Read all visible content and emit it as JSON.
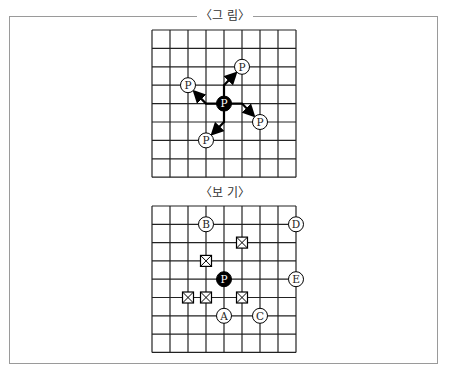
{
  "figure": {
    "title": "〈그 림〉",
    "grid": {
      "cols": 8,
      "rows": 8
    },
    "center_piece": {
      "label": "P",
      "col": 4,
      "row": 4,
      "style": "filled"
    },
    "target_pieces": [
      {
        "label": "P",
        "col": 5,
        "row": 2
      },
      {
        "label": "P",
        "col": 2,
        "row": 3
      },
      {
        "label": "P",
        "col": 6,
        "row": 5
      },
      {
        "label": "P",
        "col": 3,
        "row": 6
      }
    ],
    "arrows": [
      {
        "from": [
          4,
          4
        ],
        "via": [
          4,
          3
        ],
        "to": [
          5,
          2
        ]
      },
      {
        "from": [
          4,
          4
        ],
        "via": [
          3,
          4
        ],
        "to": [
          2,
          3
        ]
      },
      {
        "from": [
          4,
          4
        ],
        "via": [
          5,
          4
        ],
        "to": [
          6,
          5
        ]
      },
      {
        "from": [
          4,
          4
        ],
        "via": [
          4,
          5
        ],
        "to": [
          3,
          6
        ]
      }
    ]
  },
  "options": {
    "title": "〈보 기〉",
    "grid": {
      "cols": 8,
      "rows": 8
    },
    "center_piece": {
      "label": "P",
      "col": 4,
      "row": 4,
      "style": "filled"
    },
    "labeled_points": [
      {
        "label": "A",
        "col": 4,
        "row": 6
      },
      {
        "label": "B",
        "col": 3,
        "row": 1
      },
      {
        "label": "C",
        "col": 6,
        "row": 6
      },
      {
        "label": "D",
        "col": 8,
        "row": 1
      },
      {
        "label": "E",
        "col": 8,
        "row": 4
      }
    ],
    "blocked_points": [
      {
        "col": 5,
        "row": 2
      },
      {
        "col": 3,
        "row": 3
      },
      {
        "col": 2,
        "row": 5
      },
      {
        "col": 3,
        "row": 5
      },
      {
        "col": 5,
        "row": 5
      }
    ]
  },
  "colors": {
    "line": "#222222",
    "frame": "#9a9a9a",
    "filled": "#000000"
  }
}
